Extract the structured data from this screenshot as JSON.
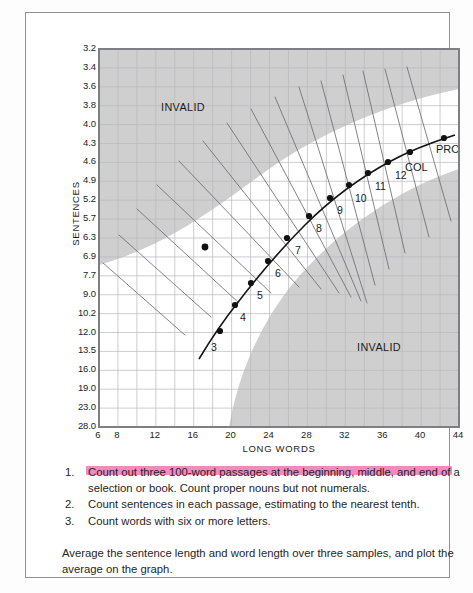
{
  "chart_data": {
    "type": "line",
    "title": "",
    "xlabel": "LONG WORDS",
    "ylabel": "SENTENCES",
    "xlim": [
      6,
      44
    ],
    "ylim_labels_top_to_bottom": [
      "3.2",
      "3.4",
      "3.6",
      "3.8",
      "4.0",
      "4.3",
      "4.6",
      "4.9",
      "5.2",
      "5.7",
      "6.3",
      "6.9",
      "7.7",
      "9.0",
      "10.2",
      "12.0",
      "13.5",
      "16.0",
      "19.0",
      "23.0",
      "28.0"
    ],
    "xticks": [
      6,
      8,
      12,
      16,
      20,
      24,
      28,
      32,
      36,
      40,
      44
    ],
    "xticks_labels": [
      "6",
      "8",
      "12",
      "16",
      "20",
      "24",
      "28",
      "32",
      "36",
      "40",
      "44"
    ],
    "grid": true,
    "legend": "none",
    "annotations": [
      "INVALID",
      "INVALID",
      "PROF",
      "COL"
    ],
    "series": [
      {
        "name": "grade level curve",
        "points": [
          {
            "label": "3",
            "x": 17.2,
            "y_label": "8.3"
          },
          {
            "label": "4",
            "x": 18.6,
            "y_label": "7.7"
          },
          {
            "label": "5",
            "x": 19.9,
            "y_label": "7.1"
          },
          {
            "label": "6",
            "x": 21.4,
            "y_label": "6.6"
          },
          {
            "label": "7",
            "x": 23.2,
            "y_label": "6.1"
          },
          {
            "label": "8",
            "x": 25.3,
            "y_label": "5.6"
          },
          {
            "label": "9",
            "x": 27.3,
            "y_label": "5.2"
          },
          {
            "label": "10",
            "x": 29.1,
            "y_label": "4.9"
          },
          {
            "label": "11",
            "x": 31.0,
            "y_label": "4.7"
          },
          {
            "label": "12",
            "x": 33.0,
            "y_label": "4.5"
          },
          {
            "label": "COL",
            "x": 35.4,
            "y_label": "4.3"
          },
          {
            "label": "PROF",
            "x": 39.5,
            "y_label": "4.0"
          }
        ]
      },
      {
        "name": "plotted sample",
        "points": [
          {
            "label": "",
            "x": 18.2,
            "y_label": "6.4"
          }
        ]
      }
    ]
  },
  "axes": {
    "y_label": "SENTENCES",
    "x_label": "LONG WORDS",
    "y_ticks": [
      "3.2",
      "3.4",
      "3.6",
      "3.8",
      "4.0",
      "4.3",
      "4.6",
      "4.9",
      "5.2",
      "5.7",
      "6.3",
      "6.9",
      "7.7",
      "9.0",
      "10.2",
      "12.0",
      "13.5",
      "16.0",
      "19.0",
      "23.0",
      "28.0"
    ],
    "x_ticks": [
      "6",
      "8",
      "12",
      "16",
      "20",
      "24",
      "28",
      "32",
      "36",
      "40",
      "44"
    ]
  },
  "regions": {
    "invalid_top": "INVALID",
    "invalid_bottom": "INVALID"
  },
  "grade_markers": [
    "3",
    "4",
    "5",
    "6",
    "7",
    "8",
    "9",
    "10",
    "11",
    "12"
  ],
  "level_markers": {
    "college": "COL",
    "professional": "PROF"
  },
  "notes": [
    {
      "num": "1.",
      "text": "Count out three 100-word passages at the beginning, middle, and end of a selection or book. Count proper nouns but not numerals.",
      "highlighted": true
    },
    {
      "num": "2.",
      "text": "Count sentences in each passage, estimating to the nearest tenth.",
      "highlighted": false
    },
    {
      "num": "3.",
      "text": "Count words with six or more letters.",
      "highlighted": false
    }
  ],
  "summary": "Average the sentence length and word length over three samples, and plot the average on the graph.",
  "colors": {
    "highlight": "#f07ab4",
    "invalid_fill": "#cfcfcf",
    "grid": "#b9b9bd",
    "curve": "#1a1a1a",
    "frame": "#8f9196"
  }
}
